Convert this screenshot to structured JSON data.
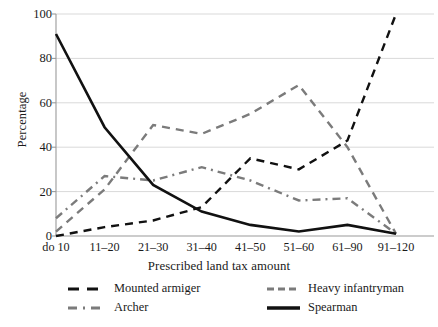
{
  "chart_data": {
    "type": "line",
    "title": "",
    "xlabel": "Prescribed land tax amount",
    "ylabel": "Percentage",
    "categories": [
      "do 10",
      "11–20",
      "21–30",
      "31–40",
      "41–50",
      "51–60",
      "61–90",
      "91–120"
    ],
    "ylim": [
      0,
      100
    ],
    "yticks": [
      0,
      20,
      40,
      60,
      80,
      100
    ],
    "grid": "horizontal",
    "legend_position": "bottom",
    "series": [
      {
        "name": "Mounted armiger",
        "style": "dashed",
        "color": "#111111",
        "values": [
          0,
          4,
          7,
          13,
          35,
          30,
          43,
          100
        ]
      },
      {
        "name": "Heavy infantryman",
        "style": "dashed",
        "color": "#7b7b7b",
        "values": [
          2,
          21,
          50,
          46,
          55,
          68,
          40,
          1
        ]
      },
      {
        "name": "Archer",
        "style": "dash-dot",
        "color": "#7b7b7b",
        "values": [
          8,
          27,
          25,
          31,
          25,
          16,
          17,
          1
        ]
      },
      {
        "name": "Spearman",
        "style": "solid",
        "color": "#111111",
        "values": [
          91,
          49,
          23,
          11,
          5,
          2,
          5,
          1
        ]
      }
    ]
  },
  "legend": {
    "items": [
      {
        "label": "Mounted armiger"
      },
      {
        "label": "Heavy infantryman"
      },
      {
        "label": "Archer"
      },
      {
        "label": "Spearman"
      }
    ]
  },
  "colors": {
    "dark_line": "#111111",
    "gray_line": "#7b7b7b",
    "grid": "#d9d9d9",
    "axis": "#9a9a9a",
    "text": "#1a1a1a"
  }
}
